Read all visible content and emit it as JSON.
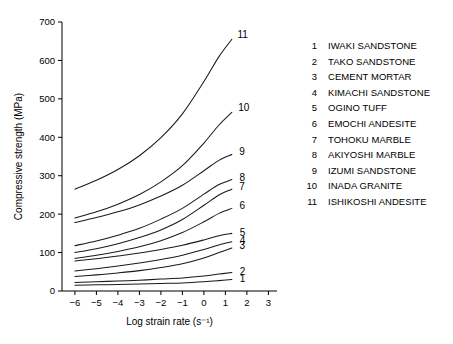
{
  "chart_data": {
    "type": "line",
    "title": "",
    "xlabel": "Log strain rate (s⁻¹)",
    "ylabel": "Compressive strength (MPa)",
    "xlim": [
      -6.6,
      3.4
    ],
    "ylim": [
      0,
      700
    ],
    "xticks": [
      -6,
      -5,
      -4,
      -3,
      -2,
      -1,
      0,
      1,
      2,
      3
    ],
    "xtick_labels": [
      "−6",
      "−5",
      "−4",
      "−3",
      "−2",
      "−1",
      "0",
      "1",
      "2",
      "3"
    ],
    "yticks": [
      0,
      100,
      200,
      300,
      400,
      500,
      600,
      700
    ],
    "ytick_labels": [
      "0",
      "100",
      "200",
      "300",
      "400",
      "500",
      "600",
      "700"
    ],
    "grid": false,
    "legend_position": "right",
    "x": [
      -6,
      -5,
      -4,
      -3,
      -2,
      -1,
      0,
      0.7,
      1.3
    ],
    "series": [
      {
        "name": "IWAKI SANDSTONE",
        "number": "1",
        "label": "1",
        "values": [
          15,
          16,
          17,
          18,
          19.5,
          21,
          24,
          27,
          30
        ]
      },
      {
        "name": "TAKO SANDSTONE",
        "number": "2",
        "label": "2",
        "values": [
          22,
          24,
          26,
          28,
          31,
          34,
          39,
          44,
          48
        ]
      },
      {
        "name": "CEMENT MORTAR",
        "number": "3",
        "label": "3",
        "values": [
          38,
          42,
          47,
          53,
          61,
          71,
          86,
          100,
          112
        ]
      },
      {
        "name": "KIMACHI SANDSTONE",
        "number": "4",
        "label": "4",
        "values": [
          52,
          58,
          65,
          73,
          82,
          93,
          108,
          120,
          128
        ]
      },
      {
        "name": "OGINO TUFF",
        "number": "5",
        "label": "5",
        "values": [
          78,
          84,
          91,
          99,
          108,
          119,
          133,
          144,
          150
        ]
      },
      {
        "name": "EMOCHI ANDESITE",
        "number": "6",
        "label": "6",
        "values": [
          85,
          93,
          103,
          115,
          131,
          152,
          180,
          202,
          215
        ]
      },
      {
        "name": "TOHOKU MARBLE",
        "number": "7",
        "label": "7",
        "values": [
          100,
          110,
          123,
          139,
          159,
          186,
          223,
          250,
          265
        ]
      },
      {
        "name": "AKIYOSHI MARBLE",
        "number": "8",
        "label": "8",
        "values": [
          118,
          130,
          145,
          163,
          187,
          215,
          252,
          277,
          290
        ]
      },
      {
        "name": "IZUMI SANDSTONE",
        "number": "9",
        "label": "9",
        "values": [
          178,
          191,
          206,
          224,
          247,
          275,
          313,
          340,
          355
        ]
      },
      {
        "name": "INADA GRANITE",
        "number": "10",
        "label": "10",
        "values": [
          190,
          206,
          226,
          251,
          284,
          326,
          385,
          432,
          465
        ]
      },
      {
        "name": "ISHIKOSHI ANDESITE",
        "number": "11",
        "label": "11",
        "values": [
          265,
          288,
          316,
          352,
          399,
          461,
          545,
          610,
          655
        ]
      }
    ]
  },
  "legend": {
    "entries": [
      {
        "num": "1",
        "name": "IWAKI SANDSTONE"
      },
      {
        "num": "2",
        "name": "TAKO SANDSTONE"
      },
      {
        "num": "3",
        "name": "CEMENT MORTAR"
      },
      {
        "num": "4",
        "name": "KIMACHI SANDSTONE"
      },
      {
        "num": "5",
        "name": "OGINO TUFF"
      },
      {
        "num": "6",
        "name": "EMOCHI ANDESITE"
      },
      {
        "num": "7",
        "name": "TOHOKU MARBLE"
      },
      {
        "num": "8",
        "name": "AKIYOSHI MARBLE"
      },
      {
        "num": "9",
        "name": "IZUMI SANDSTONE"
      },
      {
        "num": "10",
        "name": "INADA GRANITE"
      },
      {
        "num": "11",
        "name": "ISHIKOSHI ANDESITE"
      }
    ]
  },
  "caption": {
    "text": ""
  },
  "colors": {
    "curve": "#1a1a1a",
    "axis": "#000000",
    "background": "#ffffff"
  }
}
